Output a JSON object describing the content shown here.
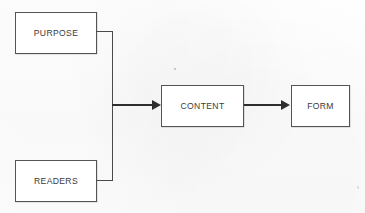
{
  "diagram": {
    "type": "flowchart",
    "background_color": "#fdfdfd",
    "box_border_color": "#545454",
    "box_fill_color": "#ffffff",
    "connector_color": "#4a4a4a",
    "arrow_color": "#2e2e2e",
    "text_color": "#3a3a3a",
    "nodes": [
      {
        "id": "purpose",
        "label": "PURPOSE"
      },
      {
        "id": "readers",
        "label": "READERS"
      },
      {
        "id": "content",
        "label": "CONTENT"
      },
      {
        "id": "form",
        "label": "FORM"
      }
    ],
    "edges": [
      {
        "from": "purpose",
        "to": "content",
        "arrow": true
      },
      {
        "from": "readers",
        "to": "content",
        "arrow": true
      },
      {
        "from": "content",
        "to": "form",
        "arrow": true
      }
    ]
  }
}
